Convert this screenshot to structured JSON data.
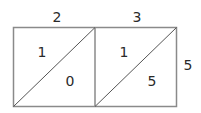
{
  "diagram": {
    "type": "lattice-multiplication",
    "top_digits": [
      "2",
      "3"
    ],
    "right_digits": [
      "5"
    ],
    "cells": [
      {
        "upper": "1",
        "lower": "0"
      },
      {
        "upper": "1",
        "lower": "5"
      }
    ],
    "line_color": "#8a8a8a"
  }
}
